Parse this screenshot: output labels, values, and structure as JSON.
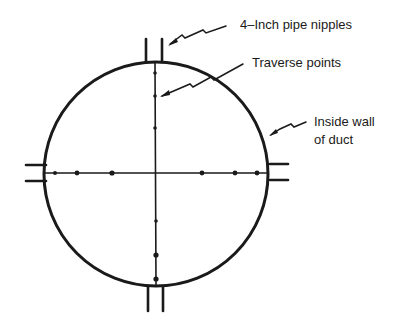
{
  "labels": {
    "nipples": "4–Inch pipe nipples",
    "traverse": "Traverse points",
    "wall_line1": "Inside wall",
    "wall_line2": "of duct"
  },
  "colors": {
    "ink": "#1a1a1a",
    "background": "#ffffff"
  }
}
